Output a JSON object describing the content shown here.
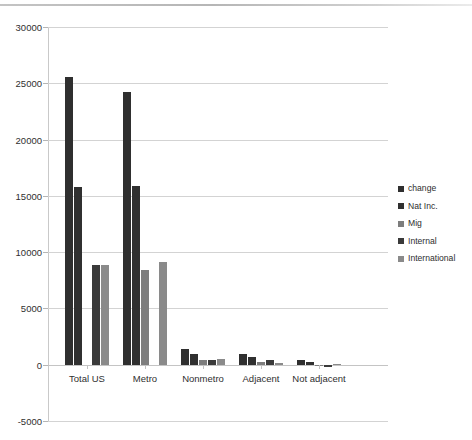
{
  "chart_data": {
    "type": "bar",
    "title": "",
    "subtitle": "",
    "xlabel": "",
    "ylabel": "",
    "categories": [
      "Total US",
      "Metro",
      "Nonmetro",
      "Adjacent",
      "Not adjacent"
    ],
    "series": [
      {
        "name": "change",
        "color": "#2f2f2f",
        "values": [
          25600,
          24200,
          1400,
          950,
          430
        ]
      },
      {
        "name": "Nat Inc.",
        "color": "#303030",
        "values": [
          15800,
          15900,
          950,
          700,
          250
        ]
      },
      {
        "name": "Mig",
        "color": "#7d7d7d",
        "values": [
          0,
          8400,
          430,
          260,
          -70
        ]
      },
      {
        "name": "Internal",
        "color": "#3a3a3a",
        "values": [
          8900,
          0,
          430,
          430,
          -230
        ]
      },
      {
        "name": "International",
        "color": "#8a8a8a",
        "values": [
          8900,
          9100,
          520,
          120,
          60
        ]
      }
    ],
    "ylim": [
      -5000,
      30000
    ],
    "ytick_values": [
      -5000,
      0,
      5000,
      10000,
      15000,
      20000,
      25000,
      30000
    ],
    "ytick_labels": [
      "-5000",
      "0",
      "5000",
      "10000",
      "15000",
      "20000",
      "25000",
      "30000"
    ],
    "grid": true,
    "legend_position": "right",
    "legend_entries": [
      "change",
      "Nat Inc.",
      "Mig",
      "Internal",
      "International"
    ]
  },
  "legend": {
    "items": [
      {
        "label": "change"
      },
      {
        "label": "Nat Inc."
      },
      {
        "label": "Mig"
      },
      {
        "label": "Internal"
      },
      {
        "label": "International"
      }
    ]
  }
}
